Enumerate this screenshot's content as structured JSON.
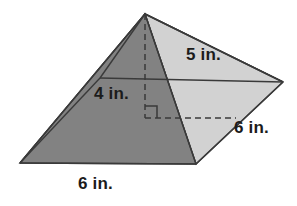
{
  "figure": {
    "shape": "square-pyramid",
    "colors": {
      "face_front_left": "#828282",
      "face_back_left": "#949494",
      "face_front_right": "#d2d2d2",
      "face_back_right": "#eaeaea",
      "outline": "#3a3a3a",
      "dashed": "#3a3a3a",
      "background": "#ffffff",
      "label_text": "#1b1b1b"
    },
    "geometry": {
      "apex": [
        145,
        14
      ],
      "base_left": [
        20,
        163
      ],
      "base_front": [
        196,
        164
      ],
      "base_right": [
        283,
        82
      ],
      "base_back": [
        100,
        78
      ],
      "center": [
        150,
        121
      ],
      "height_foot": [
        145,
        118
      ]
    }
  },
  "labels": {
    "slant_height": "5 in.",
    "height": "4 in.",
    "depth": "6 in.",
    "base": "6 in."
  },
  "annotations": {
    "right_angle_marker": "right-angle",
    "height_line_style": "dashed",
    "depth_line_style": "dashed"
  }
}
